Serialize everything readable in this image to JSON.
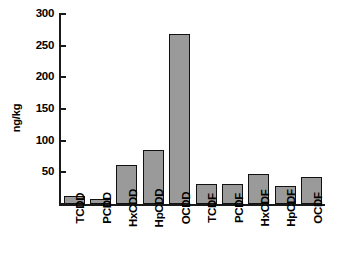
{
  "chart_data": {
    "type": "bar",
    "title": "",
    "subtitle": "",
    "xlabel": "",
    "ylabel": "ng/kg",
    "categories": [
      "TCDD",
      "PCDD",
      "HxCDD",
      "HpCDD",
      "OCDD",
      "TCDF",
      "PCDF",
      "HxCDF",
      "HpCDF",
      "OCDF"
    ],
    "values": [
      13,
      8,
      62,
      86,
      268,
      31,
      32,
      47,
      29,
      42
    ],
    "series": [
      {
        "name": "Concentration",
        "values": [
          13,
          8,
          62,
          86,
          268,
          31,
          32,
          47,
          29,
          42
        ]
      }
    ],
    "ylim": [
      0,
      300
    ],
    "y_ticks": [
      0,
      50,
      100,
      150,
      200,
      250,
      300
    ],
    "y_tick_labels": [
      "",
      "50",
      "100",
      "150",
      "200",
      "250",
      "300"
    ],
    "grid": false,
    "legend": null,
    "legend_position": "none",
    "annotations": [],
    "bar_fill_color": "#9a9a9a",
    "bar_edge_color": "#111111",
    "axis_color": "#1a1a1a",
    "background_color": "#ffffff",
    "x_tick_label_rotation": 90
  }
}
